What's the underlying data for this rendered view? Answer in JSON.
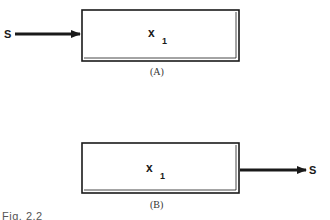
{
  "diagram": {
    "colors": {
      "stroke": "#1a1a1a",
      "background": "#ffffff"
    },
    "panels": [
      {
        "id": "A",
        "caption": "(A)",
        "box_label": "x",
        "box_subscript": "1",
        "signal_label": "S",
        "arrow_direction": "into-box-from-left"
      },
      {
        "id": "B",
        "caption": "(B)",
        "box_label": "x",
        "box_subscript": "1",
        "signal_label": "S",
        "arrow_direction": "out-of-box-to-right"
      }
    ],
    "figure_caption_partial": "Fig. 2.2"
  }
}
